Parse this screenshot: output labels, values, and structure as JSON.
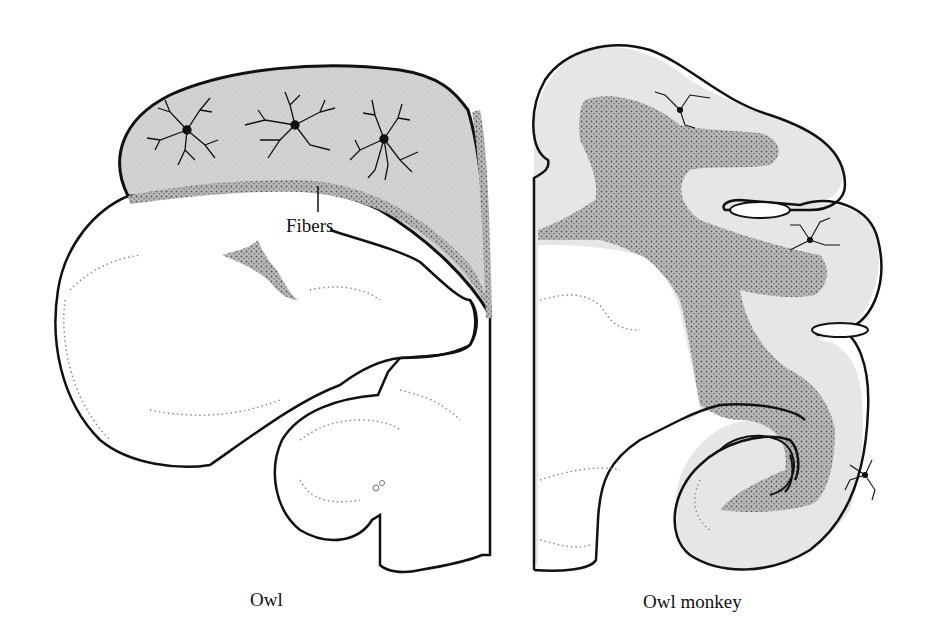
{
  "figure": {
    "panels": [
      {
        "id": "owl",
        "caption": "Owl"
      },
      {
        "id": "owl-monkey",
        "caption": "Owl monkey"
      }
    ],
    "annotations": {
      "fibers": "Fibers"
    },
    "colors": {
      "outline": "#111111",
      "gray_matter_light": "#cfcfcf",
      "gray_matter_monkey": "#e4e4e4",
      "stipple_dark": "#8f8f8f",
      "background": "#ffffff"
    }
  }
}
